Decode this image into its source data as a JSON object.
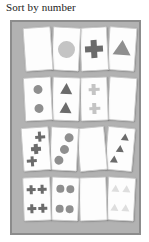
{
  "title": "Sort by number",
  "panel": {
    "background_color": "#b2b2b2",
    "border_color": "#8c8c8c",
    "card_color": "#fdfdfd"
  },
  "palette": {
    "dark": "#6b6b6b",
    "medium": "#8f8f8f",
    "light": "#c4c4c4",
    "very_light": "#dedede"
  },
  "rows": [
    {
      "row_label": "row-1-count-1",
      "count": 1,
      "cards": [
        {
          "shape": "star",
          "count": 1,
          "color": "#6b6b6b",
          "rotation": -4,
          "left": 12,
          "size": 18
        },
        {
          "shape": "circle",
          "count": 1,
          "color": "#c4c4c4",
          "rotation": 3,
          "left": 40,
          "size": 17
        },
        {
          "shape": "cross",
          "count": 1,
          "color": "#6b6b6b",
          "rotation": -3,
          "left": 68,
          "size": 18
        },
        {
          "shape": "triangle",
          "count": 1,
          "color": "#8f8f8f",
          "rotation": 4,
          "left": 96,
          "size": 18
        }
      ]
    },
    {
      "row_label": "row-2-count-2",
      "count": 2,
      "cards": [
        {
          "shape": "circle",
          "count": 2,
          "color": "#8f8f8f",
          "rotation": -3,
          "left": 12,
          "size": 9
        },
        {
          "shape": "triangle",
          "count": 2,
          "color": "#6b6b6b",
          "rotation": 2,
          "left": 40,
          "size": 13
        },
        {
          "shape": "cross",
          "count": 2,
          "color": "#c4c4c4",
          "rotation": -2,
          "left": 68,
          "size": 11
        },
        {
          "shape": "star",
          "count": 2,
          "color": "#6b6b6b",
          "rotation": 4,
          "left": 96,
          "size": 12
        }
      ]
    },
    {
      "row_label": "row-3-count-3",
      "count": 3,
      "cards": [
        {
          "shape": "cross",
          "count": 3,
          "color": "#6b6b6b",
          "rotation": -4,
          "left": 10,
          "size": 10
        },
        {
          "shape": "circle",
          "count": 3,
          "color": "#8f8f8f",
          "rotation": 3,
          "left": 38,
          "size": 9
        },
        {
          "shape": "star",
          "count": 3,
          "color": "#c4c4c4",
          "rotation": -5,
          "left": 66,
          "size": 11
        },
        {
          "shape": "triangle",
          "count": 3,
          "color": "#6b6b6b",
          "rotation": 5,
          "left": 94,
          "size": 9
        }
      ]
    },
    {
      "row_label": "row-4-count-4",
      "count": 4,
      "cards": [
        {
          "shape": "cross",
          "count": 4,
          "color": "#6b6b6b",
          "rotation": -2,
          "left": 11,
          "size": 9
        },
        {
          "shape": "circle",
          "count": 4,
          "color": "#8f8f8f",
          "rotation": 2,
          "left": 39,
          "size": 8
        },
        {
          "shape": "star",
          "count": 4,
          "color": "#6b6b6b",
          "rotation": -2,
          "left": 67,
          "size": 9
        },
        {
          "shape": "triangle",
          "count": 4,
          "color": "#dedede",
          "rotation": 3,
          "left": 95,
          "size": 9
        }
      ]
    }
  ]
}
